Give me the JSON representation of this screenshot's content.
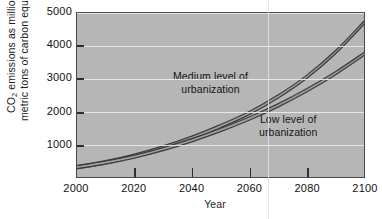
{
  "chart_data": {
    "type": "line",
    "title": "",
    "xlabel": "Year",
    "ylabel_line1": "CO2 emissions as millions of",
    "ylabel_line2": "metric tons of carbon equivalent",
    "ylabel_prefix": "CO",
    "ylabel_sub": "2",
    "ylabel_rest": " emissions as millions of",
    "xlim": [
      2000,
      2100
    ],
    "ylim": [
      0,
      5000
    ],
    "grid": true,
    "legend_position": "inline-annotations",
    "xticks": [
      2000,
      2020,
      2040,
      2060,
      2080,
      2100
    ],
    "xtick_labels": [
      "2000",
      "2020",
      "2040",
      "2060",
      "2080",
      "2100"
    ],
    "yticks": [
      1000,
      2000,
      3000,
      4000,
      5000
    ],
    "ytick_labels": [
      "1000",
      "2000",
      "3000",
      "4000",
      "5000"
    ],
    "x": [
      2000,
      2010,
      2020,
      2030,
      2040,
      2050,
      2060,
      2070,
      2080,
      2090,
      2100
    ],
    "series": [
      {
        "name": "Medium level of urbanization",
        "annotation_line1": "Medium level of",
        "annotation_line2": "urbanization",
        "color": "#3b3b3b",
        "values": [
          300,
          450,
          650,
          900,
          1200,
          1550,
          1950,
          2450,
          3050,
          3800,
          4700
        ]
      },
      {
        "name": "Low level of urbanization",
        "annotation_line1": "Low level of",
        "annotation_line2": "urbanization",
        "color": "#3b3b3b",
        "values": [
          300,
          440,
          620,
          850,
          1120,
          1430,
          1780,
          2180,
          2640,
          3160,
          3750
        ]
      }
    ],
    "colors": {
      "plot_background": "#b6b6b6",
      "figure_background": "#ffffff",
      "gridline": "#ececec",
      "axis": "#4a4a4a",
      "text": "#111111",
      "curve": "#3b3b3b"
    }
  }
}
